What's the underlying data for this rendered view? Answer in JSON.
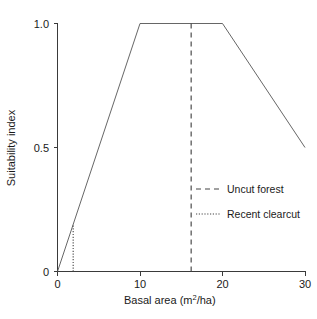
{
  "chart_data": {
    "type": "line",
    "title": "",
    "xlabel": "Basal area (m²/ha)",
    "xlabel_base": "Basal area (m",
    "xlabel_sup": "2",
    "xlabel_tail": "/ha)",
    "ylabel": "Suitability index",
    "xlim": [
      0,
      30
    ],
    "ylim": [
      0,
      1.0
    ],
    "grid": false,
    "legend_position": "center-right",
    "x_ticks": [
      {
        "value": 0,
        "label": "0"
      },
      {
        "value": 10,
        "label": "10"
      },
      {
        "value": 20,
        "label": "20"
      },
      {
        "value": 30,
        "label": "30"
      }
    ],
    "y_ticks": [
      {
        "value": 0,
        "label": "0"
      },
      {
        "value": 0.5,
        "label": "0.5"
      },
      {
        "value": 1.0,
        "label": "1.0"
      }
    ],
    "series": [
      {
        "name": "Suitability index",
        "style": "solid",
        "x": [
          0,
          10,
          20,
          30
        ],
        "values": [
          0.0,
          1.0,
          1.0,
          0.5
        ]
      }
    ],
    "reference_lines": [
      {
        "name": "Uncut forest",
        "label": "Uncut forest",
        "style": "dashed",
        "x": 16.2,
        "y_start": 0.0,
        "y_end": 1.0,
        "color": "#444444"
      },
      {
        "name": "Recent clearcut",
        "label": "Recent clearcut",
        "style": "dotted",
        "x": 1.9,
        "y_start": 0.0,
        "y_end": 0.19,
        "color": "#444444"
      }
    ],
    "legend": [
      {
        "label": "Uncut forest",
        "style": "dashed"
      },
      {
        "label": "Recent clearcut",
        "style": "dotted"
      }
    ]
  },
  "axis": {
    "y_title": "Suitability index",
    "x_tick_0": "0",
    "x_tick_10": "10",
    "x_tick_20": "20",
    "x_tick_30": "30",
    "y_tick_0": "0",
    "y_tick_05": "0.5",
    "y_tick_10": "1.0"
  },
  "legend": {
    "item_uncut": "Uncut forest",
    "item_clearcut": "Recent clearcut"
  },
  "xlabel": {
    "base": "Basal area (m",
    "sup": "2",
    "tail": "/ha)"
  }
}
